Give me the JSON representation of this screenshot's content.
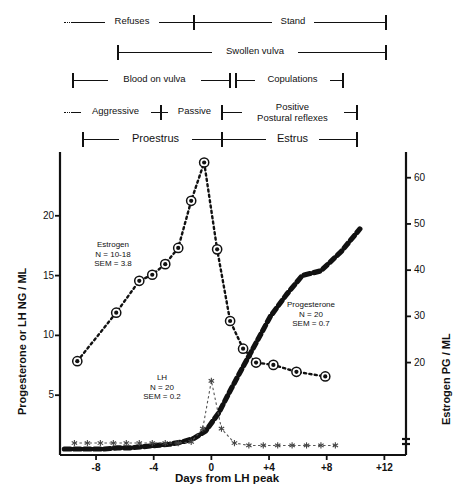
{
  "figure": {
    "title": "",
    "behavior_rows": [
      {
        "name": "row-refuses-stand",
        "segments": [
          {
            "label": "Refuses",
            "x0": 64,
            "x1": 194,
            "style": "dotted-start",
            "cap_left": false,
            "cap_right": true
          },
          {
            "label": "Stand",
            "x0": 194,
            "x1": 386,
            "style": "solid",
            "cap_left": false,
            "cap_right": true
          }
        ]
      },
      {
        "name": "row-swollen-vulva",
        "segments": [
          {
            "label": "Swollen vulva",
            "x0": 118,
            "x1": 386,
            "style": "solid",
            "cap_left": true,
            "cap_right": true
          }
        ]
      },
      {
        "name": "row-blood-copulations",
        "segments": [
          {
            "label": "Blood on vulva",
            "x0": 73,
            "x1": 230,
            "style": "solid",
            "cap_left": true,
            "cap_right": true
          },
          {
            "label": "Copulations",
            "x0": 236,
            "x1": 343,
            "style": "solid",
            "cap_left": true,
            "cap_right": true
          }
        ]
      },
      {
        "name": "row-aggressive-passive-positive",
        "segments": [
          {
            "label": "Aggressive",
            "x0": 64,
            "x1": 161,
            "style": "dotted-start",
            "cap_left": false,
            "cap_right": true
          },
          {
            "label": "Passive",
            "x0": 161,
            "x1": 222,
            "style": "solid",
            "cap_left": false,
            "cap_right": true
          },
          {
            "label": "Positive\nPostural reflexes",
            "x0": 222,
            "x1": 357,
            "style": "solid",
            "cap_left": false,
            "cap_right": true
          }
        ]
      },
      {
        "name": "row-proestrus-estrus",
        "segments": [
          {
            "label": "Proestrus",
            "x0": 83,
            "x1": 222,
            "style": "solid",
            "cap_left": true,
            "cap_right": true,
            "big": true
          },
          {
            "label": "Estrus",
            "x0": 222,
            "x1": 357,
            "style": "solid",
            "cap_left": false,
            "cap_right": true,
            "big": true
          }
        ]
      }
    ],
    "annotations": [
      {
        "name": "estrogen-annotation",
        "lines": [
          "Estrogen",
          "N = 10-18",
          "SEM = 3.8"
        ],
        "x": 113,
        "y": 240
      },
      {
        "name": "progesterone-annotation",
        "lines": [
          "Progesterone",
          "N = 20",
          "SEM = 0.7"
        ],
        "x": 311,
        "y": 300
      },
      {
        "name": "lh-annotation",
        "lines": [
          "LH",
          "N = 20",
          "SEM = 0.2"
        ],
        "x": 162,
        "y": 373
      }
    ]
  },
  "chart_data": {
    "type": "line",
    "title": "",
    "xlabel": "Days from LH peak",
    "ylabel": "Progesterone or LH NG / ML",
    "ylabel_right": "Estrogen PG / ML",
    "xlim": [
      -10.5,
      13.5
    ],
    "xticks": [
      -8,
      -4,
      0,
      4,
      8,
      12
    ],
    "xticklabels": [
      "-8",
      "-4",
      "0",
      "+4",
      "+8",
      "+12"
    ],
    "ylim": [
      0,
      25.5
    ],
    "yticks": [
      5,
      10,
      15,
      20
    ],
    "yticklabels": [
      "5",
      "10",
      "15",
      "20"
    ],
    "ylim_right": [
      0,
      66
    ],
    "yticks_right": [
      20,
      30,
      40,
      50,
      60
    ],
    "yticklabels_right": [
      "20",
      "30",
      "40",
      "50",
      "60"
    ],
    "grid": false,
    "legend": "none (inline annotations)",
    "series": [
      {
        "name": "Estrogen",
        "axis": "right",
        "unit": "PG / ML",
        "n": "10-18",
        "sem": 3.8,
        "marker": "circle-with-dot",
        "line": "dotted",
        "x": [
          -9.3,
          -6.6,
          -5.0,
          -4.1,
          -3.2,
          -2.3,
          -1.4,
          -0.5,
          0.4,
          1.3,
          2.2,
          3.1,
          4.3,
          5.9,
          7.9
        ],
        "values_pg_ml": [
          20.3,
          30.8,
          37.7,
          39.0,
          41.3,
          44.8,
          55.0,
          63.3,
          44.5,
          29.0,
          23.0,
          20.0,
          19.5,
          18.0,
          17.0
        ]
      },
      {
        "name": "Progesterone",
        "axis": "left",
        "unit": "NG / ML",
        "n": 20,
        "sem": 0.7,
        "marker": "thick-dash",
        "line": "thick-dashed",
        "x": [
          -10.2,
          -9.2,
          -8.3,
          -7.4,
          -6.5,
          -5.6,
          -4.7,
          -3.8,
          -2.9,
          -2.0,
          -1.2,
          -0.4,
          0.5,
          1.4,
          2.3,
          3.2,
          4.1,
          5.2,
          6.3,
          7.6,
          9.0,
          10.3
        ],
        "values_ng_ml": [
          0.5,
          0.5,
          0.5,
          0.5,
          0.6,
          0.6,
          0.7,
          0.8,
          0.9,
          1.1,
          1.4,
          2.0,
          3.5,
          5.6,
          7.6,
          9.6,
          11.6,
          13.4,
          15.0,
          15.4,
          17.0,
          18.9
        ]
      },
      {
        "name": "LH",
        "axis": "left",
        "unit": "NG / ML",
        "n": 20,
        "sem": 0.2,
        "marker": "small-star",
        "line": "fine-dashed",
        "x": [
          -9.5,
          -8.6,
          -7.7,
          -6.8,
          -5.9,
          -5.0,
          -4.1,
          -3.2,
          -2.3,
          -1.4,
          -0.6,
          0.0,
          0.7,
          1.6,
          2.6,
          3.6,
          4.6,
          5.6,
          6.6,
          7.6,
          8.6
        ],
        "values_ng_ml": [
          1.0,
          1.0,
          1.0,
          1.0,
          1.0,
          1.0,
          1.0,
          1.0,
          1.0,
          1.1,
          2.2,
          6.2,
          2.2,
          1.0,
          0.8,
          0.8,
          0.8,
          0.8,
          0.8,
          0.8,
          0.8
        ]
      }
    ]
  },
  "colors": {
    "ink": "#111111",
    "background": "#ffffff"
  }
}
